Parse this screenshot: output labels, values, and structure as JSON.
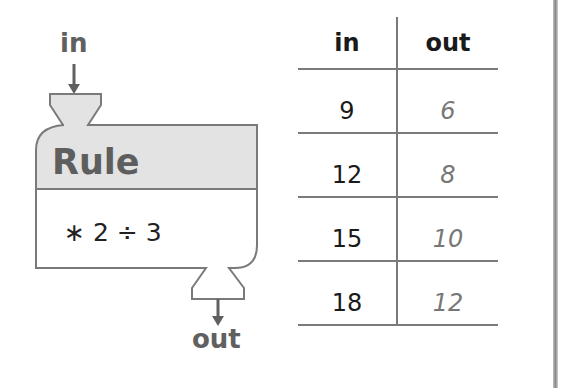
{
  "machine": {
    "input_label": "in",
    "output_label": "out",
    "title": "Rule",
    "expression": "∗ 2 ÷ 3",
    "colors": {
      "header_fill": "#e3e3e3",
      "stroke": "#7a7a7a",
      "title_text": "#5e5e5e"
    }
  },
  "table": {
    "headers": [
      "in",
      "out"
    ],
    "rows": [
      {
        "in": "9",
        "out": "6"
      },
      {
        "in": "12",
        "out": "8"
      },
      {
        "in": "15",
        "out": "10"
      },
      {
        "in": "18",
        "out": "12"
      }
    ]
  }
}
